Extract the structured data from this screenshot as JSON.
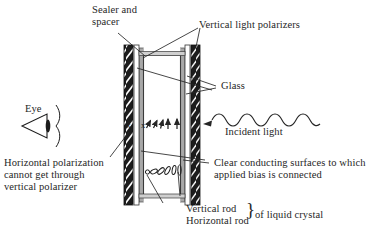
{
  "figure": {
    "title_implicit": "Liquid crystal display (LCD) cross-section",
    "background_color": "#ffffff",
    "ink_color": "#262626",
    "polarizer_color": "#1a1a1a",
    "glass_color": "#9a9a9a",
    "conductor_color": "#b5b5b5"
  },
  "labels": {
    "sealer_spacer_line1": "Sealer and",
    "sealer_spacer_line2": "spacer",
    "vertical_light_polarizers": "Vertical light polarizers",
    "glass": "Glass",
    "incident_light": "Incident light",
    "eye": "Eye",
    "horizontal_polarization_line1": "Horizontal polarization",
    "horizontal_polarization_line2": "cannot get through",
    "horizontal_polarization_line3": "vertical polarizer",
    "clear_conducting_line1": "Clear conducting surfaces to which",
    "clear_conducting_line2": "applied bias is connected",
    "vertical_rod": "Vertical rod",
    "horizontal_rod": "Horizontal rod",
    "of_liquid_crystal": "of liquid crystal",
    "brace": "}",
    "polarization_marker_left": "x",
    "polarization_marker_right": "x"
  },
  "structure": {
    "cell_left_x": 124,
    "cell_right_x": 200,
    "cell_top_y": 45,
    "cell_bottom_y": 205,
    "layers": [
      {
        "name": "left-vertical-polarizer",
        "type": "polarizer",
        "orientation": "vertical"
      },
      {
        "name": "left-glass",
        "type": "glass"
      },
      {
        "name": "left-conducting-surface",
        "type": "conductor"
      },
      {
        "name": "liquid-crystal-layer",
        "type": "liquid-crystal"
      },
      {
        "name": "right-conducting-surface",
        "type": "conductor"
      },
      {
        "name": "right-glass",
        "type": "glass"
      },
      {
        "name": "right-vertical-polarizer",
        "type": "polarizer",
        "orientation": "vertical"
      }
    ]
  },
  "molecule_row": {
    "description": "Liquid crystal rods twisting from horizontal (circle end-on) to vertical",
    "rod_angles_deg": [
      0,
      22,
      45,
      62,
      80,
      90
    ],
    "count": 6
  },
  "polarization_row": {
    "description": "Light polarization rotating from horizontal (x, end-on) to vertical (arrow)",
    "arrow_angles_deg": [
      28,
      40,
      55,
      75,
      90,
      90
    ],
    "x_markers": 2
  },
  "icons": {
    "eye_icon": "eye-cone-icon",
    "wave_icon": "sine-wave-arrow-icon",
    "brace_icon": "curly-brace-icon"
  }
}
